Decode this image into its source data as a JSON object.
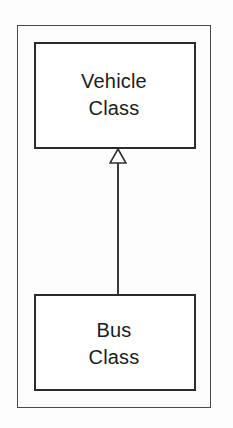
{
  "diagram": {
    "type": "uml-class-diagram",
    "background_color": "#fdfdfd",
    "frame": {
      "name": "outer-frame",
      "stroke_color": "#4a4a4a"
    },
    "classes": [
      {
        "id": "vehicle",
        "line1": "Vehicle",
        "line2": "Class",
        "stroke_color": "#2b2b2b",
        "fill_color": "#ffffff"
      },
      {
        "id": "bus",
        "line1": "Bus",
        "line2": "Class",
        "stroke_color": "#2b2b2b",
        "fill_color": "#ffffff"
      }
    ],
    "relationship": {
      "kind": "generalization",
      "from": "Bus Class",
      "to": "Vehicle Class",
      "arrow_style": "hollow-triangle",
      "stroke_color": "#3a3a3a"
    }
  }
}
